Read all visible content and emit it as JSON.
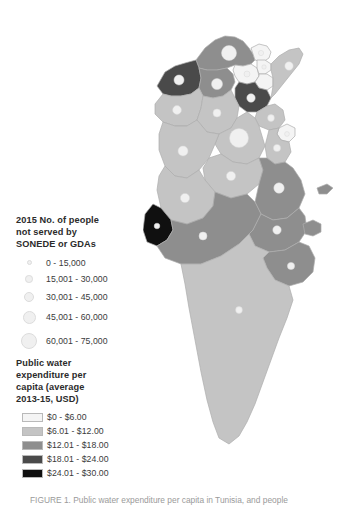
{
  "figure": {
    "caption_partial": "FIGURE 1.  Public water expenditure per capita in Tunisia, and people"
  },
  "legend": {
    "circles": {
      "title": "2015 No. of people\nnot served by\nSONEDE or GDAs",
      "classes": [
        {
          "label": "0 - 15,000",
          "size_px": 4.5,
          "color": "#f2f2f2"
        },
        {
          "label": "15,001 - 30,000",
          "size_px": 7.0,
          "color": "#f0f0f0"
        },
        {
          "label": "30,001 - 45,000",
          "size_px": 9.5,
          "color": "#eeeeee"
        },
        {
          "label": "45,001 - 60,000",
          "size_px": 12.5,
          "color": "#ededed"
        },
        {
          "label": "60,001 - 75,000",
          "size_px": 15.5,
          "color": "#ececec"
        }
      ]
    },
    "choropleth": {
      "title": "Public water\nexpenditure per\ncapita (average\n2013-15, USD)",
      "classes": [
        {
          "label": "$0 - $6.00",
          "color": "#f4f4f4"
        },
        {
          "label": "$6.01 - $12.00",
          "color": "#c4c4c4"
        },
        {
          "label": "$12.01 - $18.00",
          "color": "#8e8e8e"
        },
        {
          "label": "$18.01 - $24.00",
          "color": "#4a4a4a"
        },
        {
          "label": "$24.01 - $30.00",
          "color": "#101010"
        }
      ]
    }
  },
  "map": {
    "country": "Tunisia",
    "regions": [
      {
        "name": "bizerte",
        "fill": "#8e8e8e"
      },
      {
        "name": "jendouba",
        "fill": "#4a4a4a"
      },
      {
        "name": "beja",
        "fill": "#8e8e8e"
      },
      {
        "name": "ariana",
        "fill": "#f4f4f4"
      },
      {
        "name": "tunis",
        "fill": "#f4f4f4"
      },
      {
        "name": "manouba",
        "fill": "#f4f4f4"
      },
      {
        "name": "ben-arous",
        "fill": "#f4f4f4"
      },
      {
        "name": "zaghouan",
        "fill": "#4a4a4a"
      },
      {
        "name": "nabeul",
        "fill": "#c4c4c4"
      },
      {
        "name": "kef",
        "fill": "#c4c4c4"
      },
      {
        "name": "siliana",
        "fill": "#c4c4c4"
      },
      {
        "name": "sousse",
        "fill": "#c4c4c4"
      },
      {
        "name": "monastir",
        "fill": "#f4f4f4"
      },
      {
        "name": "mahdia",
        "fill": "#c4c4c4"
      },
      {
        "name": "kairouan",
        "fill": "#c4c4c4"
      },
      {
        "name": "kasserine",
        "fill": "#c4c4c4"
      },
      {
        "name": "sidi-bouzid",
        "fill": "#c4c4c4"
      },
      {
        "name": "sfax",
        "fill": "#8e8e8e"
      },
      {
        "name": "gafsa",
        "fill": "#c4c4c4"
      },
      {
        "name": "tozeur",
        "fill": "#101010"
      },
      {
        "name": "kebili",
        "fill": "#8e8e8e"
      },
      {
        "name": "gabes",
        "fill": "#8e8e8e"
      },
      {
        "name": "medenine",
        "fill": "#8e8e8e"
      },
      {
        "name": "tataouine",
        "fill": "#c4c4c4"
      }
    ],
    "symbol_color": "#f0f0f0"
  }
}
